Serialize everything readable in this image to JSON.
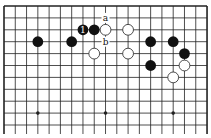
{
  "diagram": {
    "type": "go-board",
    "board_size": 19,
    "visible_rows": 11,
    "origin": {
      "x": 4,
      "y": 6
    },
    "spacing": {
      "x": 11.28,
      "y": 11.9
    },
    "colors": {
      "line": "#222222",
      "black": "#111111",
      "white": "#ffffff",
      "background": "#ffffff"
    },
    "star_points": [
      [
        3,
        9
      ],
      [
        9,
        9
      ],
      [
        15,
        9
      ]
    ],
    "black_stones": [
      {
        "col": 3,
        "row": 3,
        "label": ""
      },
      {
        "col": 6,
        "row": 3,
        "label": ""
      },
      {
        "col": 7,
        "row": 2,
        "label": "1"
      },
      {
        "col": 8,
        "row": 2,
        "label": ""
      },
      {
        "col": 13,
        "row": 3,
        "label": ""
      },
      {
        "col": 15,
        "row": 3,
        "label": ""
      },
      {
        "col": 16,
        "row": 4,
        "label": ""
      },
      {
        "col": 13,
        "row": 5,
        "label": ""
      }
    ],
    "white_stones": [
      {
        "col": 9,
        "row": 2,
        "label": ""
      },
      {
        "col": 11,
        "row": 2,
        "label": ""
      },
      {
        "col": 8,
        "row": 4,
        "label": ""
      },
      {
        "col": 11,
        "row": 4,
        "label": ""
      },
      {
        "col": 16,
        "row": 5,
        "label": ""
      },
      {
        "col": 15,
        "row": 6,
        "label": ""
      }
    ],
    "point_labels": [
      {
        "col": 9,
        "row": 1,
        "text": "a"
      },
      {
        "col": 9,
        "row": 3,
        "text": "b"
      }
    ]
  }
}
